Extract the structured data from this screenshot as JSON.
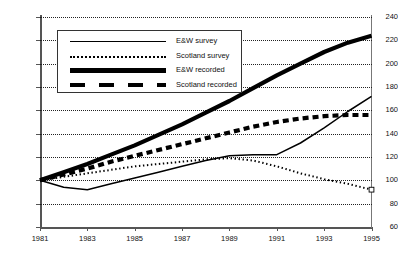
{
  "chart_data": {
    "type": "line",
    "title": "",
    "xlabel": "",
    "ylabel": "",
    "xlim": [
      1981,
      1995
    ],
    "ylim": [
      60,
      240
    ],
    "yticks": [
      60,
      80,
      100,
      120,
      140,
      160,
      180,
      200,
      220,
      240
    ],
    "xticks": [
      1981,
      1983,
      1985,
      1987,
      1989,
      1991,
      1993,
      1995
    ],
    "grid": "horizontal-dotted",
    "legend_position": "top-left-inside",
    "x": [
      1981,
      1982,
      1983,
      1984,
      1985,
      1986,
      1987,
      1988,
      1989,
      1990,
      1991,
      1992,
      1993,
      1994,
      1995
    ],
    "series": [
      {
        "name": "E&W survey",
        "style": "thin-solid",
        "color": "#000000",
        "values": [
          100,
          94,
          92,
          97,
          102,
          107,
          112,
          117,
          121,
          122,
          122,
          132,
          145,
          159,
          172
        ]
      },
      {
        "name": "Scotland survey",
        "style": "fine-dotted",
        "color": "#000000",
        "values": [
          100,
          103,
          106,
          109,
          112,
          114,
          116,
          118,
          119,
          117,
          112,
          106,
          101,
          97,
          92
        ]
      },
      {
        "name": "E&W recorded",
        "style": "thick-solid",
        "color": "#000000",
        "values": [
          100,
          107,
          114,
          122,
          130,
          139,
          148,
          158,
          168,
          179,
          190,
          200,
          210,
          218,
          224
        ]
      },
      {
        "name": "Scotland recorded",
        "style": "thick-dashed",
        "color": "#000000",
        "values": [
          100,
          105,
          110,
          116,
          121,
          126,
          131,
          136,
          141,
          146,
          150,
          153,
          155,
          156,
          156
        ]
      }
    ]
  },
  "legend": {
    "items": [
      {
        "label": "E&W survey",
        "style": "thin-solid"
      },
      {
        "label": "Scotland survey",
        "style": "fine-dotted"
      },
      {
        "label": "E&W recorded",
        "style": "thick-solid"
      },
      {
        "label": "Scotland recorded",
        "style": "thick-dashed"
      }
    ]
  },
  "axes": {
    "y_labels": [
      "240",
      "220",
      "200",
      "180",
      "160",
      "140",
      "120",
      "100",
      "80",
      "60"
    ],
    "x_labels": [
      "1981",
      "1983",
      "1985",
      "1987",
      "1989",
      "1991",
      "1993",
      "1995"
    ]
  }
}
